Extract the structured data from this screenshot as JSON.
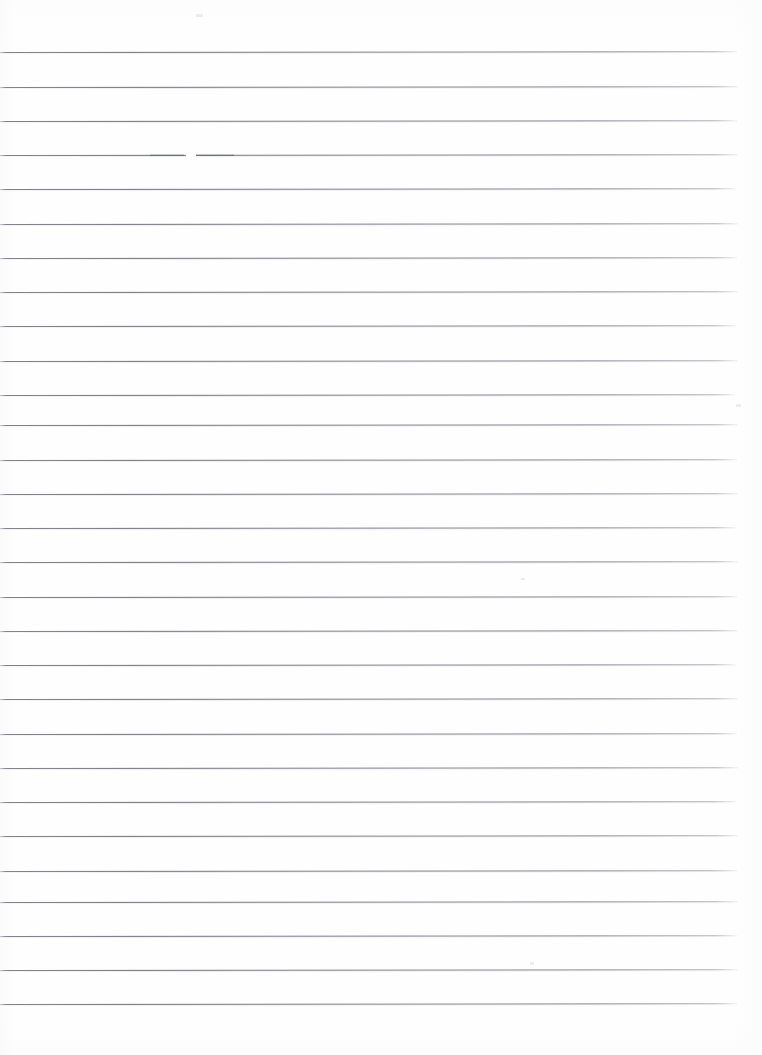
{
  "document": {
    "kind": "scanned-lined-paper",
    "title": "Blank ruled notebook page",
    "page_width": 762,
    "page_height": 1055,
    "paper_color": "#fefefe",
    "rule_color": "#6c6e76",
    "rule_count": 28,
    "rule_spacing": 34.2,
    "first_rule_y": 52,
    "rule_start_x": 0,
    "rule_end_x": 738,
    "rule_thickness": 1,
    "top_margin": 52,
    "bottom_margin": 52,
    "right_margin": 24,
    "content_text": "",
    "orientation": "portrait",
    "has_margin_line": false,
    "has_holes": false
  },
  "rules": [
    {
      "index": 1,
      "y": 52.0,
      "tilt": -0.06,
      "end_x": 737
    },
    {
      "index": 2,
      "y": 86.5,
      "tilt": -0.05,
      "end_x": 738
    },
    {
      "index": 3,
      "y": 120.5,
      "tilt": -0.06,
      "end_x": 737
    },
    {
      "index": 4,
      "y": 155.0,
      "tilt": -0.05,
      "end_x": 738,
      "artifact": "dropout"
    },
    {
      "index": 5,
      "y": 189.0,
      "tilt": -0.06,
      "end_x": 736
    },
    {
      "index": 6,
      "y": 223.5,
      "tilt": -0.05,
      "end_x": 738
    },
    {
      "index": 7,
      "y": 257.5,
      "tilt": -0.06,
      "end_x": 737
    },
    {
      "index": 8,
      "y": 292.0,
      "tilt": -0.05,
      "end_x": 738
    },
    {
      "index": 9,
      "y": 326.0,
      "tilt": -0.06,
      "end_x": 736
    },
    {
      "index": 10,
      "y": 360.5,
      "tilt": -0.05,
      "end_x": 738
    },
    {
      "index": 11,
      "y": 394.5,
      "tilt": -0.06,
      "end_x": 735
    },
    {
      "index": 12,
      "y": 425.0,
      "tilt": -0.05,
      "end_x": 738
    },
    {
      "index": 13,
      "y": 459.5,
      "tilt": -0.06,
      "end_x": 737
    },
    {
      "index": 14,
      "y": 493.5,
      "tilt": -0.05,
      "end_x": 738
    },
    {
      "index": 15,
      "y": 528.0,
      "tilt": -0.06,
      "end_x": 736
    },
    {
      "index": 16,
      "y": 562.0,
      "tilt": -0.05,
      "end_x": 738
    },
    {
      "index": 17,
      "y": 596.5,
      "tilt": -0.06,
      "end_x": 737
    },
    {
      "index": 18,
      "y": 630.5,
      "tilt": -0.05,
      "end_x": 738
    },
    {
      "index": 19,
      "y": 665.0,
      "tilt": -0.06,
      "end_x": 736
    },
    {
      "index": 20,
      "y": 699.0,
      "tilt": -0.05,
      "end_x": 738
    },
    {
      "index": 21,
      "y": 733.5,
      "tilt": -0.06,
      "end_x": 737
    },
    {
      "index": 22,
      "y": 767.5,
      "tilt": -0.05,
      "end_x": 738
    },
    {
      "index": 23,
      "y": 802.0,
      "tilt": -0.06,
      "end_x": 736
    },
    {
      "index": 24,
      "y": 836.0,
      "tilt": -0.05,
      "end_x": 738
    },
    {
      "index": 25,
      "y": 870.5,
      "tilt": -0.06,
      "end_x": 737
    },
    {
      "index": 26,
      "y": 902.0,
      "tilt": -0.05,
      "end_x": 738
    },
    {
      "index": 27,
      "y": 936.0,
      "tilt": -0.06,
      "end_x": 737
    },
    {
      "index": 28,
      "y": 969.5,
      "tilt": -0.05,
      "end_x": 738
    },
    {
      "index": 29,
      "y": 1003.5,
      "tilt": -0.06,
      "end_x": 737
    }
  ],
  "artifacts": {
    "dropout": {
      "on_rule": 4,
      "x": 186,
      "width": 10,
      "blot_x": 150,
      "blot_width": 34
    },
    "specks": [
      {
        "x": 196,
        "y": 14,
        "w": 7,
        "h": 3
      },
      {
        "x": 736,
        "y": 404,
        "w": 5,
        "h": 3
      },
      {
        "x": 521,
        "y": 578,
        "w": 4,
        "h": 2
      },
      {
        "x": 530,
        "y": 962,
        "w": 4,
        "h": 3
      }
    ]
  }
}
